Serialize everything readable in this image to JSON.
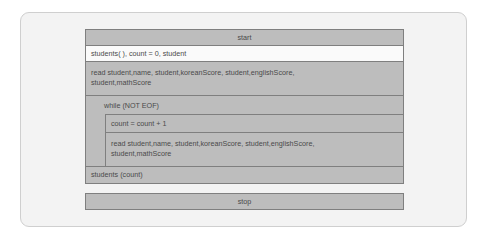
{
  "diagram": {
    "type": "nassi-shneiderman",
    "start": "start",
    "init": "students( ), count = 0, student",
    "read_first": "read student,name, student,koreanScore, student,englishScore, student,mathScore",
    "loop": {
      "condition": "while (NOT EOF)",
      "body": [
        "count = count + 1",
        "read student,name, student,koreanScore, student,englishScore, student,mathScore"
      ]
    },
    "output": "students (count)",
    "stop": "stop"
  },
  "colors": {
    "block_fill": "#bdbdbd",
    "init_fill": "#fafafa",
    "border": "#7f7f7f",
    "card": "#f3f3f3"
  }
}
